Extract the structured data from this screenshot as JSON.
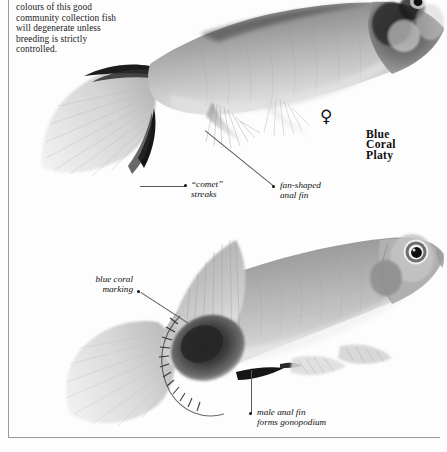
{
  "page": {
    "background": "#fdfdfd",
    "ink": "#111111",
    "rule_color": "#9a9a9a"
  },
  "body_text": "colours of this good community collection fish will degenerate unless breeding is strictly controlled.",
  "species_caption": {
    "line1": "Blue",
    "line2": "Coral",
    "line3": "Platy"
  },
  "gender_symbol": {
    "glyph": "♀",
    "meaning": "female"
  },
  "callouts": [
    {
      "id": "comet-streaks",
      "line1": "“comet”",
      "line2": "streaks"
    },
    {
      "id": "fan-shaped-anal-fin",
      "line1": "fan-shaped",
      "line2": "anal fin"
    },
    {
      "id": "blue-coral-marking",
      "line1": "blue coral",
      "line2": "marking"
    },
    {
      "id": "male-anal-fin",
      "line1": "male anal fin",
      "line2": "forms gonopodium"
    }
  ],
  "figures": [
    {
      "id": "female-platy",
      "description": "female blue coral platy, upper, facing right, cropped at top edge"
    },
    {
      "id": "male-platy",
      "description": "male blue coral platy, lower, facing right"
    }
  ]
}
